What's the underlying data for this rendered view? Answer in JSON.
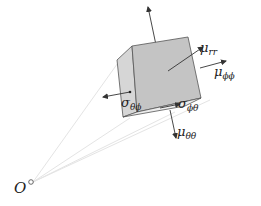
{
  "diagram": {
    "type": "stress-element",
    "origin_label": "O",
    "labels": {
      "mu_rr": "μrr",
      "mu_phiphi": "μϕϕ",
      "mu_thetatheta": "μθθ",
      "sigma_thetaphi": "σθϕ",
      "sigma_phitheta": "σϕθ"
    },
    "label_parts": {
      "mu_rr": {
        "base": "μ",
        "sub": "rr"
      },
      "mu_phiphi": {
        "base": "μ",
        "sub": "ϕϕ"
      },
      "mu_thetatheta": {
        "base": "μ",
        "sub": "θθ"
      },
      "sigma_thetaphi": {
        "base": "σ",
        "sub": "θϕ"
      },
      "sigma_phitheta": {
        "base": "σ",
        "sub": "ϕθ"
      }
    },
    "colors": {
      "cube_front": "#c4c4c4",
      "cube_side": "#d6d6d6",
      "cube_bottom": "#e8e8e8",
      "arrow": "#333333",
      "rays": "#e6e6e6"
    }
  }
}
